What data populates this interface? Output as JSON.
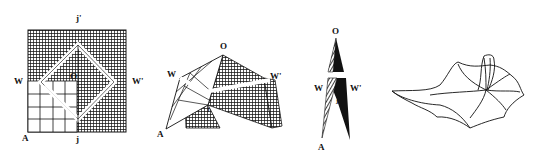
{
  "figures": [
    {
      "id": "flat-grid",
      "labels": {
        "top": "j'",
        "left": "W",
        "right": "W'",
        "center": "O",
        "corner": "A",
        "bottom": "j"
      }
    },
    {
      "id": "tent-fold",
      "labels": {
        "top": "O",
        "left": "W",
        "right": "W'",
        "corner": "A",
        "inner": "j"
      }
    },
    {
      "id": "narrow-fold",
      "labels": {
        "top": "O",
        "left": "W",
        "right": "W'",
        "corner": "A",
        "inner": "j"
      }
    },
    {
      "id": "draped-cloth",
      "labels": {}
    }
  ],
  "colors": {
    "ink": "#111111",
    "paper": "#ffffff",
    "hatch": "#333333"
  }
}
